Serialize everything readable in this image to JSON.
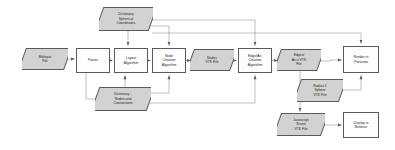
{
  "diagram": {
    "style": {
      "background": "#ffffff",
      "process_fill": "#fdfdfd",
      "data_fill": "#d2d2d2",
      "stroke": "#5a5a5a",
      "text": "#1d1d1d"
    },
    "nodes": [
      {
        "id": "bib_input",
        "label": "BibInput\nFile",
        "shape": "data",
        "x": 22,
        "y": 48,
        "w": 46,
        "h": 22
      },
      {
        "id": "parser",
        "label": "Parser",
        "shape": "process",
        "x": 76,
        "y": 48,
        "w": 34,
        "h": 25
      },
      {
        "id": "layout",
        "label": "Layout\nAlgorithm",
        "shape": "process",
        "x": 114,
        "y": 48,
        "w": 34,
        "h": 25
      },
      {
        "id": "dict_spher",
        "label": "Dictionary\nSpherical\nCoordinates",
        "shape": "data",
        "x": 99,
        "y": 7,
        "w": 54,
        "h": 24
      },
      {
        "id": "dict_nodes",
        "label": "Dictionary -\nNodes and\nConnections",
        "shape": "data",
        "x": 95,
        "y": 87,
        "w": 56,
        "h": 24
      },
      {
        "id": "node_alg",
        "label": "Node\nCreation\nAlgorithm",
        "shape": "process",
        "x": 152,
        "y": 48,
        "w": 34,
        "h": 25
      },
      {
        "id": "nodes_vtk",
        "label": "Nodes\nVTK File",
        "shape": "data",
        "x": 190,
        "y": 49,
        "w": 44,
        "h": 22
      },
      {
        "id": "edge_alg",
        "label": "Edge/Arc\nCreation\nAlgorithm",
        "shape": "process",
        "x": 238,
        "y": 48,
        "w": 34,
        "h": 25
      },
      {
        "id": "edges_vtk",
        "label": "Edges/\nArcs VTK\nFile",
        "shape": "data",
        "x": 277,
        "y": 49,
        "w": 44,
        "h": 22
      },
      {
        "id": "render",
        "label": "Render in\nParaview",
        "shape": "process",
        "x": 343,
        "y": 46,
        "w": 36,
        "h": 27
      },
      {
        "id": "radius_vtk",
        "label": "Radius 1\nSphere\nVTK File",
        "shape": "data",
        "x": 297,
        "y": 79,
        "w": 46,
        "h": 23
      },
      {
        "id": "js_scene",
        "label": "Javascript\nScene\nVTK File",
        "shape": "data",
        "x": 277,
        "y": 113,
        "w": 48,
        "h": 23
      },
      {
        "id": "display",
        "label": "Display in\nBrowser",
        "shape": "process",
        "x": 343,
        "y": 112,
        "w": 36,
        "h": 26
      }
    ],
    "edges": [
      {
        "from": "bib_input",
        "to": "parser",
        "type": "straight-right"
      },
      {
        "from": "parser",
        "to": "layout",
        "type": "straight-right"
      },
      {
        "from": "layout",
        "to": "node_alg",
        "type": "straight-right"
      },
      {
        "from": "node_alg",
        "to": "nodes_vtk",
        "type": "straight-right"
      },
      {
        "from": "nodes_vtk",
        "to": "edge_alg",
        "type": "straight-right"
      },
      {
        "from": "edge_alg",
        "to": "edges_vtk",
        "type": "straight-right"
      },
      {
        "from": "edges_vtk",
        "to": "render",
        "type": "straight-right"
      },
      {
        "from": "dict_spher",
        "to": "layout",
        "type": "down-into-top"
      },
      {
        "from": "dict_spher",
        "to": "node_alg",
        "type": "down-into-top"
      },
      {
        "from": "dict_spher",
        "to": "edge_alg",
        "type": "elbow-right-down"
      },
      {
        "from": "dict_spher",
        "to": "render",
        "type": "elbow-right-down"
      },
      {
        "from": "parser",
        "to": "dict_nodes",
        "type": "elbow-down-left"
      },
      {
        "from": "dict_nodes",
        "to": "layout",
        "type": "up-into-bottom"
      },
      {
        "from": "dict_nodes",
        "to": "node_alg",
        "type": "up-into-bottom"
      },
      {
        "from": "dict_nodes",
        "to": "edge_alg",
        "type": "elbow-right-up"
      },
      {
        "from": "radius_vtk",
        "to": "render",
        "type": "elbow-right-up"
      },
      {
        "from": "edges_vtk",
        "to": "js_scene",
        "type": "elbow-down"
      },
      {
        "from": "js_scene",
        "to": "display",
        "type": "straight-right"
      }
    ]
  }
}
